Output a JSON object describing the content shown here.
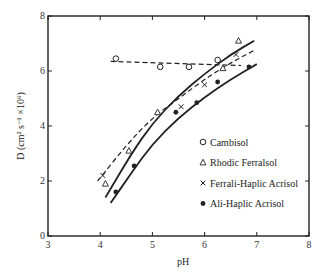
{
  "chart_data": {
    "type": "scatter",
    "title": "",
    "xlabel": "pH",
    "ylabel": "D (cm² s⁻¹ ×10⁶)",
    "xlim": [
      3,
      8
    ],
    "ylim": [
      0,
      8
    ],
    "xticks": [
      "3",
      "4",
      "5",
      "6",
      "7",
      "8"
    ],
    "yticks": [
      "0",
      "2",
      "4",
      "6",
      "8"
    ],
    "grid": false,
    "legend_position": "lower right (inside)",
    "series": [
      {
        "name": "Cambisol",
        "marker": "open-circle",
        "fit": "dashed-horizontal",
        "points": [
          [
            4.3,
            6.45
          ],
          [
            5.15,
            6.15
          ],
          [
            5.7,
            6.15
          ],
          [
            6.25,
            6.4
          ]
        ]
      },
      {
        "name": "Rhodic Ferralsol",
        "marker": "open-triangle",
        "fit": "solid-upper-curve",
        "points": [
          [
            4.1,
            1.9
          ],
          [
            4.55,
            3.1
          ],
          [
            5.1,
            4.5
          ],
          [
            6.35,
            6.1
          ],
          [
            6.65,
            7.1
          ]
        ]
      },
      {
        "name": "Ferrali-Haplic Acrisol",
        "marker": "x",
        "fit": "dashed-middle-curve",
        "points": [
          [
            4.05,
            2.2
          ],
          [
            5.55,
            4.7
          ],
          [
            6.0,
            5.5
          ],
          [
            6.6,
            6.6
          ]
        ]
      },
      {
        "name": "Ali-Haplic Acrisol",
        "marker": "filled-circle",
        "fit": "solid-lower-curve",
        "points": [
          [
            4.3,
            1.6
          ],
          [
            4.65,
            2.55
          ],
          [
            5.45,
            4.5
          ],
          [
            5.85,
            4.85
          ],
          [
            6.25,
            5.6
          ],
          [
            6.85,
            6.15
          ]
        ]
      }
    ],
    "fit_lines": {
      "cambisol": [
        [
          4.2,
          6.35
        ],
        [
          6.7,
          6.2
        ]
      ],
      "rhodic_ferralsol": [
        [
          4.1,
          1.4
        ],
        [
          4.6,
          3.0
        ],
        [
          5.0,
          4.1
        ],
        [
          5.5,
          5.1
        ],
        [
          6.0,
          5.9
        ],
        [
          6.5,
          6.6
        ],
        [
          6.95,
          7.1
        ]
      ],
      "ferrali_haplic": [
        [
          3.95,
          2.0
        ],
        [
          4.5,
          3.3
        ],
        [
          5.0,
          4.3
        ],
        [
          5.5,
          5.0
        ],
        [
          6.0,
          5.7
        ],
        [
          6.5,
          6.3
        ],
        [
          6.95,
          6.75
        ]
      ],
      "ali_haplic": [
        [
          4.2,
          1.2
        ],
        [
          4.6,
          2.3
        ],
        [
          5.0,
          3.35
        ],
        [
          5.5,
          4.3
        ],
        [
          6.0,
          5.05
        ],
        [
          6.5,
          5.7
        ],
        [
          7.0,
          6.25
        ]
      ]
    }
  },
  "legend": [
    {
      "symbol": "o",
      "label": "Cambisol"
    },
    {
      "symbol": "△",
      "label": "Rhodic Ferralsol"
    },
    {
      "symbol": "×",
      "label": "Ferrali-Haplic Acrisol"
    },
    {
      "symbol": "•",
      "label": "Ali-Haplic Acrisol"
    }
  ],
  "axes": {
    "x_label": "pH",
    "y_label": "D (cm² s⁻¹ ×10⁶)"
  }
}
